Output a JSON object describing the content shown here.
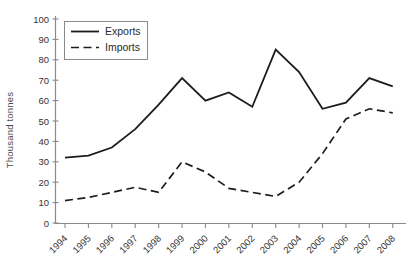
{
  "chart_data": {
    "type": "line",
    "title": "",
    "xlabel": "",
    "ylabel": "Thousand tonnes",
    "ylim": [
      0,
      100
    ],
    "ytick_step": 10,
    "grid": false,
    "legend_position": "top-left-inside",
    "axis_color": "#8a8a8a",
    "line_color": "#1c1c1c",
    "categories": [
      "1994",
      "1995",
      "1996",
      "1997",
      "1998",
      "1999",
      "2000",
      "2001",
      "2002",
      "2003",
      "2004",
      "2005",
      "2006",
      "2007",
      "2008"
    ],
    "series": [
      {
        "name": "Exports",
        "style": "solid",
        "color": "#1c1c1c",
        "values": [
          32,
          33,
          37,
          46,
          58,
          71,
          60,
          64,
          57,
          85,
          74,
          56,
          59,
          71,
          67
        ]
      },
      {
        "name": "Imports",
        "style": "dashed",
        "color": "#1c1c1c",
        "values": [
          11,
          12.5,
          15,
          17.5,
          15,
          30,
          25,
          17,
          15,
          13,
          20,
          34,
          51,
          56,
          54
        ]
      }
    ]
  }
}
